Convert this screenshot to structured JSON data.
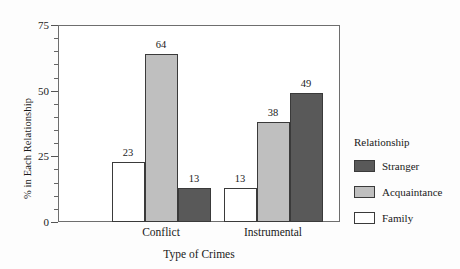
{
  "chart_data": {
    "type": "bar",
    "title": "",
    "xlabel": "Type of Crimes",
    "ylabel": "% in Each Relationship",
    "categories": [
      "Conflict",
      "Instrumental"
    ],
    "series": [
      {
        "name": "Family",
        "values": [
          23,
          13
        ],
        "color": "#ffffff"
      },
      {
        "name": "Acquaintance",
        "values": [
          64,
          38
        ],
        "color": "#bfbfbf"
      },
      {
        "name": "Stranger",
        "values": [
          13,
          49
        ],
        "color": "#595959"
      }
    ],
    "ylim": [
      0,
      75
    ],
    "yticks": [
      0,
      25,
      50,
      75
    ],
    "ytick_labels": [
      "0",
      "25",
      "50",
      "75"
    ],
    "yminor_ticks": [
      5,
      10,
      15,
      20,
      30,
      35,
      40,
      45,
      55,
      60,
      65,
      70
    ],
    "grid": false,
    "data_labels": true,
    "legend": {
      "title": "Relationship",
      "position": "right",
      "entries": [
        {
          "label": "Stranger",
          "color": "#595959"
        },
        {
          "label": "Acquaintance",
          "color": "#bfbfbf"
        },
        {
          "label": "Family",
          "color": "#ffffff"
        }
      ]
    },
    "bar_edge_color": "#3a3a3a",
    "frame_color": "#6e6e6e",
    "background": "#ffffff"
  }
}
